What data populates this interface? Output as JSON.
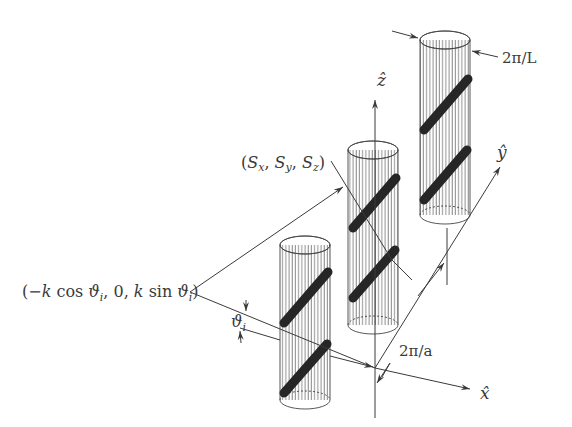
{
  "figure": {
    "type": "3D schematic of a lattice of helically wound cylinders with coordinate axes",
    "axes": {
      "x_label": "x̂",
      "y_label": "ŷ",
      "z_label": "ẑ"
    },
    "labels": {
      "incident_wavevector": "(−k cos ϑ_i, 0, k sin ϑ_i)",
      "incident_wavevector_parts": {
        "open": "(−",
        "k1": "k",
        "cos": " cos ",
        "theta1": "ϑ",
        "sub1": "i",
        "mid": ", 0, ",
        "k2": "k",
        "sin": " sin ",
        "theta2": "ϑ",
        "sub2": "i",
        "close": ")"
      },
      "scattered_wavevector": "(S_x, S_y, S_z)",
      "scattered_parts": {
        "open": "(",
        "s1": "S",
        "x": "x",
        "comma1": ", ",
        "s2": "S",
        "y": "y",
        "comma2": ", ",
        "s3": "S",
        "z": "z",
        "close": ")"
      },
      "incidence_angle": "ϑ_i",
      "incidence_angle_parts": {
        "theta": "ϑ",
        "sub": "i"
      },
      "lattice_period": "2π/a",
      "helix_period": "2π/L"
    },
    "cylinders": [
      {
        "name": "front",
        "helical_wire_segments": 2
      },
      {
        "name": "middle",
        "helical_wire_segments": 2
      },
      {
        "name": "back",
        "helical_wire_segments": 2
      }
    ],
    "colors": {
      "line": "#3a3a3a",
      "wire": "#262626",
      "hatch": "#555555",
      "background": "#ffffff"
    }
  }
}
